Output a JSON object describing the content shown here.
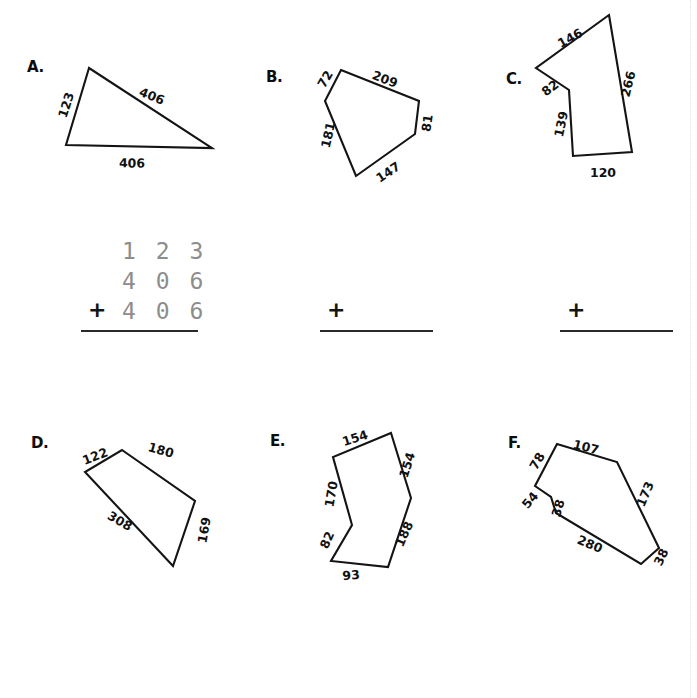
{
  "page": {
    "width": 697,
    "height": 698,
    "background": "#ffffff",
    "ink_color": "#111111",
    "traced_digit_color": "#8d8d8d"
  },
  "problems": [
    {
      "id": "A",
      "letter": "A.",
      "shape": "triangle",
      "sides": [
        "123",
        "406",
        "406"
      ],
      "polygon_points": "89,68 66,145 212,148",
      "labels": [
        {
          "text": "123",
          "x": 66,
          "y": 105,
          "rotate": -72
        },
        {
          "text": "406",
          "x": 152,
          "y": 96,
          "rotate": 22
        },
        {
          "text": "406",
          "x": 132,
          "y": 163,
          "rotate": 1
        }
      ]
    },
    {
      "id": "B",
      "letter": "B.",
      "shape": "pentagon",
      "sides": [
        "72",
        "209",
        "81",
        "147",
        "181"
      ],
      "polygon_points": "341,70 419,101 415,134 356,176 325,101",
      "labels": [
        {
          "text": "72",
          "x": 325,
          "y": 79,
          "rotate": -60
        },
        {
          "text": "209",
          "x": 385,
          "y": 79,
          "rotate": 21
        },
        {
          "text": "81",
          "x": 427,
          "y": 123,
          "rotate": -82
        },
        {
          "text": "147",
          "x": 388,
          "y": 172,
          "rotate": -34
        },
        {
          "text": "181",
          "x": 328,
          "y": 135,
          "rotate": -77
        }
      ]
    },
    {
      "id": "C",
      "letter": "C.",
      "shape": "concave-pentagon",
      "sides": [
        "146",
        "266",
        "120",
        "139",
        "82"
      ],
      "polygon_points": "609,15 632,152 573,156 569,90 536,68",
      "labels": [
        {
          "text": "146",
          "x": 570,
          "y": 38,
          "rotate": -29
        },
        {
          "text": "266",
          "x": 628,
          "y": 84,
          "rotate": -76
        },
        {
          "text": "120",
          "x": 603,
          "y": 172,
          "rotate": 0
        },
        {
          "text": "139",
          "x": 561,
          "y": 124,
          "rotate": -78
        },
        {
          "text": "82",
          "x": 550,
          "y": 88,
          "rotate": -37
        }
      ]
    },
    {
      "id": "D",
      "letter": "D.",
      "shape": "quadrilateral",
      "sides": [
        "122",
        "180",
        "169",
        "308"
      ],
      "polygon_points": "122,450 195,501 173,566 85,472",
      "labels": [
        {
          "text": "122",
          "x": 95,
          "y": 456,
          "rotate": -21
        },
        {
          "text": "180",
          "x": 161,
          "y": 450,
          "rotate": 16
        },
        {
          "text": "169",
          "x": 204,
          "y": 530,
          "rotate": -80
        },
        {
          "text": "308",
          "x": 120,
          "y": 521,
          "rotate": 30
        }
      ]
    },
    {
      "id": "E",
      "letter": "E.",
      "shape": "concave-hexagon",
      "sides": [
        "154",
        "154",
        "188",
        "93",
        "82",
        "170"
      ],
      "polygon_points": "391,433 411,498 388,567 331,561 352,525 333,457",
      "labels": [
        {
          "text": "154",
          "x": 355,
          "y": 438,
          "rotate": -18
        },
        {
          "text": "154",
          "x": 407,
          "y": 465,
          "rotate": -72
        },
        {
          "text": "188",
          "x": 404,
          "y": 534,
          "rotate": -66
        },
        {
          "text": "93",
          "x": 351,
          "y": 575,
          "rotate": -5
        },
        {
          "text": "82",
          "x": 327,
          "y": 540,
          "rotate": -66
        },
        {
          "text": "170",
          "x": 331,
          "y": 494,
          "rotate": -80
        }
      ]
    },
    {
      "id": "F",
      "letter": "F.",
      "shape": "concave-heptagon",
      "sides": [
        "78",
        "107",
        "173",
        "38",
        "280",
        "38",
        "54"
      ],
      "polygon_points": "557,444 617,462 659,548 641,564 556,513 551,497 535,486",
      "labels": [
        {
          "text": "78",
          "x": 537,
          "y": 461,
          "rotate": -60
        },
        {
          "text": "107",
          "x": 586,
          "y": 447,
          "rotate": 14
        },
        {
          "text": "173",
          "x": 645,
          "y": 494,
          "rotate": -67
        },
        {
          "text": "38",
          "x": 661,
          "y": 557,
          "rotate": -64
        },
        {
          "text": "280",
          "x": 590,
          "y": 544,
          "rotate": 23
        },
        {
          "text": "38",
          "x": 558,
          "y": 508,
          "rotate": -73
        },
        {
          "text": "54",
          "x": 530,
          "y": 500,
          "rotate": -50
        }
      ]
    }
  ],
  "work_area": {
    "plus_sign": "+",
    "blocks": [
      {
        "for_problem": "A",
        "filled": true,
        "addends": [
          "1 2 3",
          "4 0 6",
          "4 0 6"
        ]
      },
      {
        "for_problem": "B",
        "filled": false,
        "addends": []
      },
      {
        "for_problem": "C",
        "filled": false,
        "addends": []
      }
    ]
  }
}
